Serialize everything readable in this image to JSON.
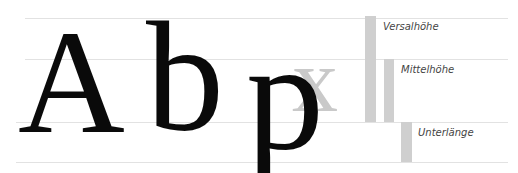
{
  "diagram": {
    "title": "",
    "glyphs": {
      "capital": "A",
      "ascender": "b",
      "descender": "p",
      "xheight_sample": "x"
    },
    "metrics": [
      {
        "id": "versalhoehe",
        "label": "Versalhöhe",
        "meaning": "cap height"
      },
      {
        "id": "mittelhoehe",
        "label": "Mittelhöhe",
        "meaning": "x-height"
      },
      {
        "id": "unterlaenge",
        "label": "Unterlänge",
        "meaning": "descender"
      }
    ],
    "guide_lines": [
      "cap-line",
      "x-height-line",
      "baseline",
      "descender-line"
    ],
    "colors": {
      "glyph": "#0a0a0a",
      "sample_gray": "#c9c9c9",
      "bar_gray": "#cfcfcf",
      "line_gray": "#e2e2e2",
      "label": "#444444"
    }
  }
}
